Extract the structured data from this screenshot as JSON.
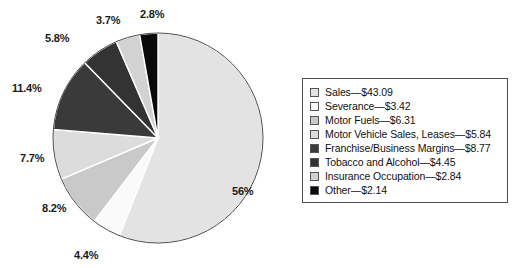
{
  "chart_data": {
    "type": "pie",
    "title": "",
    "subtitle": "",
    "xlabel": "",
    "ylabel": "",
    "grid": false,
    "legend_position": "right",
    "units": "billions of dollars",
    "start_angle_deg": 0,
    "direction": "clockwise",
    "center": {
      "x": 158,
      "y": 138,
      "radius": 106
    },
    "categories": [
      "Sales",
      "Severance",
      "Motor Fuels",
      "Motor Vehicle Sales, Leases",
      "Franchise/Business Margins",
      "Tobacco and Alcohol",
      "Insurance Occupation",
      "Other"
    ],
    "values": [
      43.09,
      3.42,
      6.31,
      5.84,
      8.77,
      4.45,
      2.84,
      2.14
    ],
    "percent_labels": [
      "56%",
      "4.4%",
      "8.2%",
      "7.7%",
      "11.4%",
      "5.8%",
      "3.7%",
      "2.8%"
    ],
    "percents": [
      56.0,
      4.4,
      8.2,
      7.7,
      11.4,
      5.8,
      3.7,
      2.8
    ],
    "colors": [
      "#e3e3e3",
      "#fafafa",
      "#c9c9c9",
      "#dcdcdc",
      "#3a3a3a",
      "#333333",
      "#d2d2d2",
      "#0a0a0a"
    ],
    "slice_border": "#ffffff",
    "outline": "#4d4d4d"
  },
  "pie": {
    "labels": {
      "sales": "56%",
      "severance": "4.4%",
      "motor_fuels": "8.2%",
      "motor_vehicle": "7.7%",
      "franchise": "11.4%",
      "tobacco": "5.8%",
      "insurance": "3.7%",
      "other": "2.8%"
    }
  },
  "legend": {
    "items": [
      {
        "label": "Sales—$43.09",
        "color": "#e3e3e3"
      },
      {
        "label": "Severance—$3.42",
        "color": "#fafafa"
      },
      {
        "label": "Motor Fuels—$6.31",
        "color": "#c9c9c9"
      },
      {
        "label": "Motor Vehicle Sales, Leases—$5.84",
        "color": "#dcdcdc"
      },
      {
        "label": "Franchise/Business Margins—$8.77",
        "color": "#3a3a3a"
      },
      {
        "label": "Tobacco and Alcohol—$4.45",
        "color": "#333333"
      },
      {
        "label": "Insurance Occupation—$2.84",
        "color": "#d2d2d2"
      },
      {
        "label": "Other—$2.14",
        "color": "#0a0a0a"
      }
    ]
  }
}
